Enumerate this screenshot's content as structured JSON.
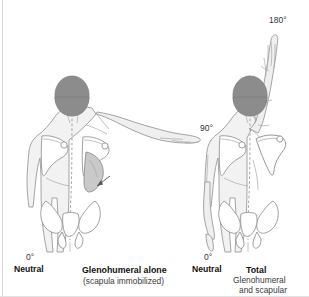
{
  "figure": {
    "view": "posterior (back) view of upper torso and pelvis",
    "panels": [
      {
        "id": "left",
        "motion_label": "90°",
        "start_label": "0°",
        "start_name": "Neutral",
        "caption_bold": "Glenohumeral alone",
        "caption_sub": "(scapula immobilized)",
        "arm_position": "right arm abducted horizontally to 90 degrees",
        "annotation": "arrow indicating immobilized scapula"
      },
      {
        "id": "right",
        "motion_label": "180°",
        "start_label": "0°",
        "start_name": "Neutral",
        "caption_bold": "Total",
        "caption_sub_1": "Glenohumeral",
        "caption_sub_2": "and scapular",
        "arm_position": "right arm fully abducted overhead to 180 degrees",
        "annotation": "scapula rotates upward with humerus"
      }
    ],
    "anatomy": {
      "head": "shaded head, occipital view",
      "scapula": "scapula outline both sides",
      "pelvis": "pelvis and sacrum outline",
      "spine": "dashed midline spinal axis"
    },
    "colors": {
      "head_fill": "#8c8c8c",
      "body_fill": "#f2f2f2",
      "outline": "#9a9a9a",
      "bone_outline": "#8f8f8f",
      "bone_fill": "#ffffff",
      "highlight_fill": "#c9c9c9",
      "text": "#111111",
      "rule": "#d8d8d8",
      "background": "#ffffff"
    }
  }
}
